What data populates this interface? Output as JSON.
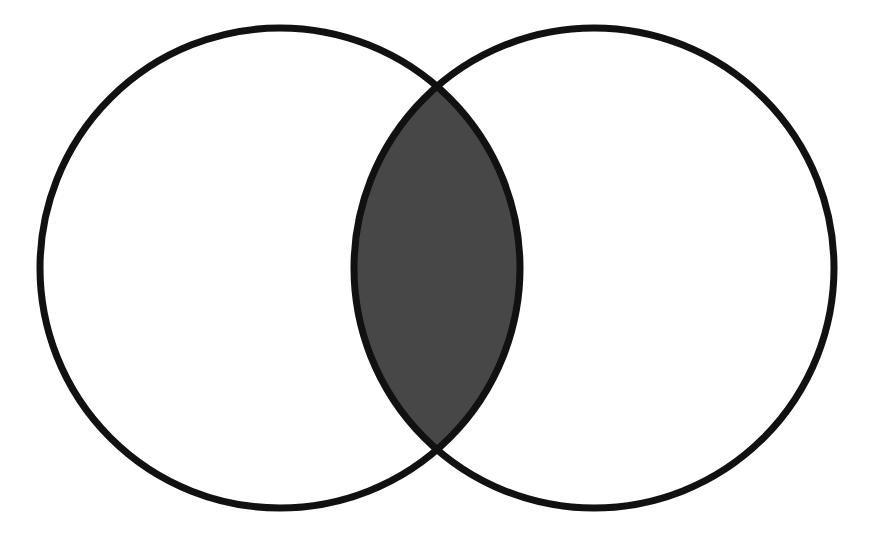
{
  "figure": {
    "type": "venn-2-set",
    "background_color": "#ffffff",
    "canvas": {
      "width": 874,
      "height": 542
    },
    "stroke": {
      "color": "#111111",
      "width": 7
    },
    "shading": {
      "intersection_fill": "#474747",
      "set_fill": "#ffffff",
      "shaded_region": "intersection"
    },
    "sets": [
      {
        "id": "set-a",
        "label": "",
        "position": "left",
        "center_x": 280,
        "center_y": 268,
        "radius": 240,
        "fill": "#ffffff",
        "stroke": "#111111"
      },
      {
        "id": "set-b",
        "label": "",
        "position": "right",
        "center_x": 594,
        "center_y": 268,
        "radius": 240,
        "fill": "#ffffff",
        "stroke": "#111111"
      }
    ],
    "intersection": {
      "id": "intersection-lens",
      "label": "",
      "shaded": true,
      "fill": "#474747",
      "top_point_x": 437,
      "top_point_y": 100,
      "bottom_point_x": 437,
      "bottom_point_y": 445,
      "left_extent_x": 365,
      "right_extent_x": 505,
      "center_x": 437,
      "center_y": 268
    },
    "labels": {
      "set_a_caption": "",
      "set_b_caption": "",
      "intersection_caption": "",
      "figure_caption": ""
    }
  },
  "chart_data": {
    "type": "venn",
    "title": "",
    "sets": [
      "A",
      "B"
    ],
    "regions": [
      {
        "name": "A only",
        "shaded": false,
        "fill": "#ffffff"
      },
      {
        "name": "B only",
        "shaded": false,
        "fill": "#ffffff"
      },
      {
        "name": "A ∩ B",
        "shaded": true,
        "fill": "#474747"
      }
    ],
    "values": [
      0,
      0,
      0
    ],
    "categories": [
      "A only",
      "B only",
      "A ∩ B"
    ],
    "legend": [],
    "xlabel": "",
    "ylabel": "",
    "grid": false
  }
}
